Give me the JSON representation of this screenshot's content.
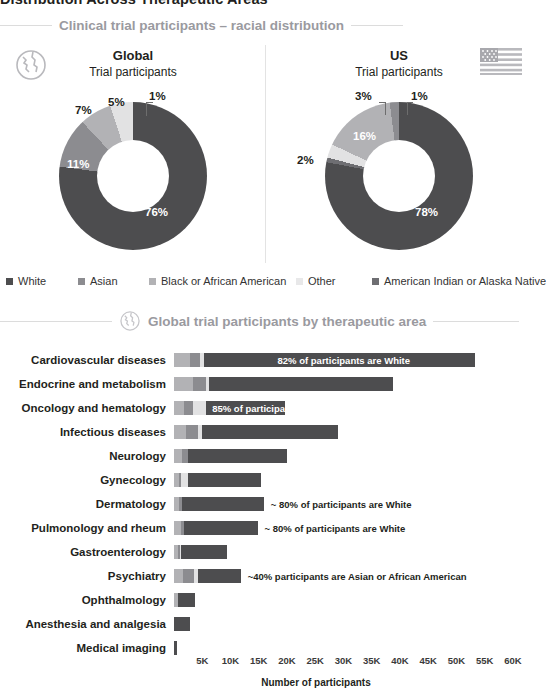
{
  "page": {
    "title": "Distribution Across Therapeutic Areas"
  },
  "colors": {
    "white_race": "#4d4d4f",
    "asian": "#8c8c90",
    "black_african_american": "#b2b2b5",
    "other": "#e2e2e3",
    "american_indian_alaska_native": "#6e6e72",
    "section_heading": "#9a9a9f",
    "rule": "#dcdcdc",
    "text": "#231f20"
  },
  "sections": {
    "racial": {
      "heading": "Clinical trial participants – racial distribution",
      "icon": "globe-icon"
    },
    "therapeutic": {
      "heading": "Global trial participants by therapeutic area",
      "icon": "globe-icon"
    }
  },
  "legend": {
    "items": [
      {
        "label": "White",
        "color": "#4d4d4f"
      },
      {
        "label": "Asian",
        "color": "#8c8c90"
      },
      {
        "label": "Black or African American",
        "color": "#b2b2b5"
      },
      {
        "label": "Other",
        "color": "#e8e8e9"
      },
      {
        "label": "American Indian or Alaska Native",
        "color": "#6e6e72"
      }
    ]
  },
  "chart_data": [
    {
      "type": "pie",
      "id": "global-donut",
      "title": "Global",
      "subtitle": "Trial participants",
      "icon": "globe-icon",
      "labels": [
        "White",
        "Asian",
        "Black or African American",
        "Other",
        "American Indian or Alaska Native"
      ],
      "values": [
        76,
        11,
        7,
        5,
        1
      ],
      "value_labels": [
        "76%",
        "11%",
        "7%",
        "5%",
        "1%"
      ],
      "units": "percent",
      "legend": "bottom"
    },
    {
      "type": "pie",
      "id": "us-donut",
      "title": "US",
      "subtitle": "Trial participants",
      "icon": "us-flag-icon",
      "labels": [
        "White",
        "Asian",
        "Black or African American",
        "Other",
        "American Indian or Alaska Native"
      ],
      "values": [
        78,
        2,
        16,
        3,
        1
      ],
      "value_labels": [
        "78%",
        "2%",
        "16%",
        "3%",
        "1%"
      ],
      "units": "percent",
      "legend": "bottom"
    },
    {
      "type": "bar",
      "id": "therapeutic-bars",
      "orientation": "horizontal",
      "stacked": true,
      "title": "Global trial participants by therapeutic area",
      "xlabel": "Number of participants",
      "ylabel": "",
      "xlim": [
        0,
        60000
      ],
      "xticks": [
        "5K",
        "10K",
        "15K",
        "20K",
        "25K",
        "30K",
        "35K",
        "40K",
        "45K",
        "50K",
        "55K",
        "60K"
      ],
      "xtick_values": [
        5000,
        10000,
        15000,
        20000,
        25000,
        30000,
        35000,
        40000,
        45000,
        50000,
        55000,
        60000
      ],
      "grid": false,
      "categories": [
        "Cardiovascular diseases",
        "Endocrine and metabolism",
        "Oncology and hematology",
        "Infectious diseases",
        "Neurology",
        "Gynecology",
        "Dermatology",
        "Pulmonology and rheum",
        "Gastroenterology",
        "Psychiatry",
        "Ophthalmology",
        "Anesthesia and analgesia",
        "Medical imaging"
      ],
      "series": [
        {
          "name": "Black or African American",
          "color": "#b2b2b5",
          "values": [
            2900,
            3300,
            1700,
            2200,
            1400,
            900,
            900,
            1200,
            700,
            1600,
            700,
            0,
            0
          ]
        },
        {
          "name": "Asian",
          "color": "#8c8c90",
          "values": [
            1700,
            2300,
            1600,
            2100,
            1100,
            400,
            500,
            600,
            400,
            2000,
            0,
            0,
            0
          ]
        },
        {
          "name": "Other",
          "color": "#e2e2e3",
          "values": [
            700,
            600,
            2400,
            700,
            0,
            1100,
            0,
            0,
            200,
            700,
            0,
            0,
            0
          ]
        },
        {
          "name": "White",
          "color": "#4d4d4f",
          "values": [
            48000,
            32500,
            14000,
            24000,
            17500,
            13000,
            14500,
            13000,
            8000,
            7500,
            3000,
            2800,
            600
          ]
        }
      ],
      "totals": [
        53300,
        38700,
        19700,
        29000,
        20000,
        15400,
        15900,
        14800,
        9300,
        11800,
        3700,
        2800,
        600
      ],
      "annotations": [
        {
          "category": "Cardiovascular diseases",
          "text": "82% of participants are White",
          "placement": "inside"
        },
        {
          "category": "Oncology and hematology",
          "text": "85% of participants are White",
          "placement": "inside"
        },
        {
          "category": "Dermatology",
          "text": "~ 80% of participants are White",
          "placement": "outside"
        },
        {
          "category": "Pulmonology and rheum",
          "text": "~ 80% of participants are White",
          "placement": "outside"
        },
        {
          "category": "Psychiatry",
          "text": "~40% participants are Asian or African American",
          "placement": "outside"
        }
      ]
    }
  ]
}
